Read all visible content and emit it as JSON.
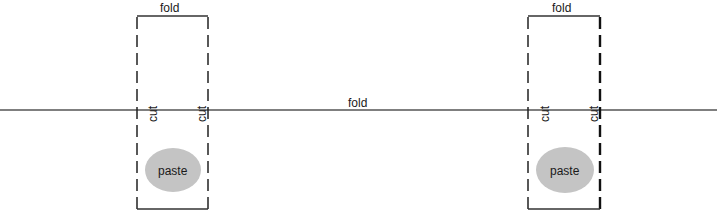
{
  "diagram": {
    "title": "",
    "main_fold": {
      "label": "fold",
      "y": 110,
      "color": "#555555"
    },
    "panels": [
      {
        "id": "left",
        "top_label": "fold",
        "cut_left_label": "cut",
        "cut_right_label": "cut",
        "paste_label": "paste",
        "x_left": 137,
        "x_right": 208
      },
      {
        "id": "right",
        "top_label": "fold",
        "cut_left_label": "cut",
        "cut_right_label": "cut",
        "paste_label": "paste",
        "x_left": 528,
        "x_right": 600
      }
    ],
    "colors": {
      "line": "#3a3a3a",
      "paste_fill": "#c4c4c4",
      "text": "#1a1a1a"
    }
  }
}
